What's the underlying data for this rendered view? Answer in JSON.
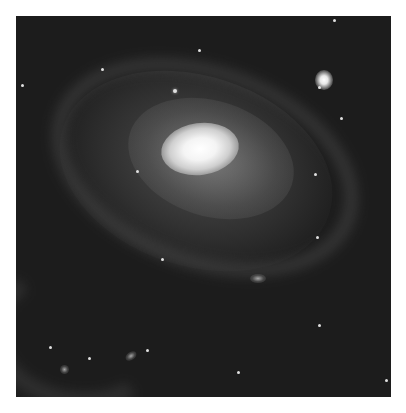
{
  "image": {
    "subject": "spiral galaxy",
    "caption": "Barred spiral galaxy with bright core, diffuse spiral arms, and a small companion galaxy at upper right",
    "background_color": "#1c1c1c",
    "border_color": "#ffffff",
    "features": [
      {
        "name": "galactic-core",
        "description": "bright white oval nucleus near center"
      },
      {
        "name": "spiral-arms",
        "description": "faint gray arms encircling core"
      },
      {
        "name": "companion-galaxy",
        "description": "small bright elliptical galaxy at upper right"
      },
      {
        "name": "outer-arm",
        "description": "faint arc at lower left"
      },
      {
        "name": "background-stars",
        "description": "scattered faint point sources"
      }
    ]
  }
}
